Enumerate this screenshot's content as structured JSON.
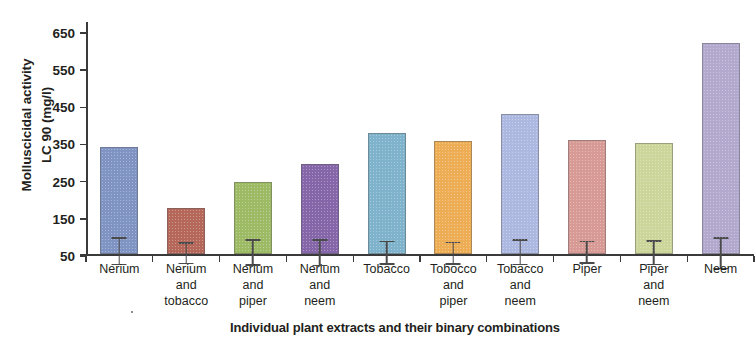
{
  "chart_data": {
    "type": "bar",
    "title": "",
    "xlabel": "Individual plant extracts and their binary combinations",
    "ylabel_line1": "Molluscicidal activity",
    "ylabel_line2": "LC 90 (mg/l)",
    "ylim": [
      50,
      650
    ],
    "yticks": [
      50,
      150,
      250,
      350,
      450,
      550,
      650
    ],
    "grid": false,
    "legend": "none",
    "categories": [
      "Nerium",
      "Nerium\nand\ntobacco",
      "Nerium\nand\npiper",
      "Nerium\nand\nneem",
      "Tobacco",
      "Tobocco\nand\npiper",
      "Tobacco\nand\nneem",
      "Piper",
      "Piper\nand\nneem",
      "Neem"
    ],
    "series": [
      {
        "name": "Molluscicidal activity LC 90 (mg/l)",
        "values": [
          340,
          175,
          245,
          293,
          378,
          356,
          428,
          358,
          350,
          620
        ],
        "error_upper": [
          383,
          205,
          283,
          332,
          412,
          388,
          466,
          392,
          385,
          663
        ],
        "error_lower": [
          308,
          146,
          212,
          258,
          348,
          325,
          396,
          330,
          318,
          577
        ]
      }
    ],
    "bar_colors": [
      "#8094c4",
      "#b5675a",
      "#9dba65",
      "#8566a8",
      "#7fb3cc",
      "#edad55",
      "#adb8e0",
      "#d79a94",
      "#ccd69a",
      "#b3a8cd"
    ],
    "error_bar_color": "#4a4a4a",
    "axis_color": "#3a3a3a",
    "text_color": "#231f20"
  }
}
